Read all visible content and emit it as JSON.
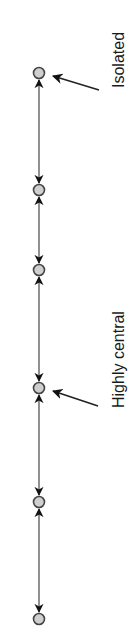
{
  "diagram": {
    "type": "linear-network",
    "orientation": "vertical",
    "colors": {
      "background": "#ffffff",
      "node_fill": "#cfcfcf",
      "node_stroke": "#444444",
      "edge": "#555555",
      "arrowhead": "#111111",
      "text": "#1a1a1a"
    },
    "nodes": [
      {
        "id": "n1",
        "x": 39,
        "y": 73
      },
      {
        "id": "n2",
        "x": 39,
        "y": 190
      },
      {
        "id": "n3",
        "x": 39,
        "y": 270
      },
      {
        "id": "n4",
        "x": 39,
        "y": 388
      },
      {
        "id": "n5",
        "x": 39,
        "y": 502
      },
      {
        "id": "n6",
        "x": 39,
        "y": 619
      }
    ],
    "edges": [
      {
        "from": "n1",
        "to": "n2",
        "bidirectional": true
      },
      {
        "from": "n2",
        "to": "n3",
        "bidirectional": true
      },
      {
        "from": "n3",
        "to": "n4",
        "bidirectional": true
      },
      {
        "from": "n4",
        "to": "n5",
        "bidirectional": true
      },
      {
        "from": "n5",
        "to": "n6",
        "bidirectional": true
      }
    ],
    "annotations": [
      {
        "text": "Isolated",
        "target": "n1",
        "text_x": 124,
        "text_y": 88,
        "arrow": {
          "x1": 99,
          "y1": 90,
          "x2": 53,
          "y2": 76
        }
      },
      {
        "text": "Highly central",
        "target": "n4",
        "text_x": 124,
        "text_y": 408,
        "arrow": {
          "x1": 98,
          "y1": 406,
          "x2": 53,
          "y2": 391
        }
      }
    ]
  }
}
